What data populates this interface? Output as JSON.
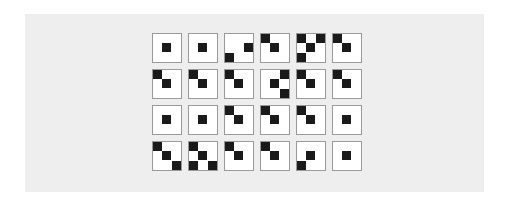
{
  "colors": {
    "page_background": "#ffffff",
    "panel_background": "#eeeeee",
    "cell_background": "#ffffff",
    "cell_border": "#9a9a9a",
    "dot": "#1a1a1a"
  },
  "grid": {
    "rows": 4,
    "columns": 6,
    "subgrid": 3,
    "cells": [
      [
        [
          [
            1,
            1
          ]
        ],
        [
          [
            1,
            1
          ]
        ],
        [
          [
            1,
            2
          ],
          [
            2,
            0
          ]
        ],
        [
          [
            0,
            0
          ],
          [
            1,
            1
          ]
        ],
        [
          [
            0,
            0
          ],
          [
            0,
            2
          ],
          [
            1,
            1
          ],
          [
            2,
            0
          ]
        ],
        [
          [
            0,
            0
          ],
          [
            1,
            1
          ]
        ]
      ],
      [
        [
          [
            0,
            0
          ],
          [
            1,
            1
          ]
        ],
        [
          [
            0,
            0
          ],
          [
            1,
            1
          ]
        ],
        [
          [
            0,
            0
          ],
          [
            1,
            1
          ]
        ],
        [
          [
            0,
            2
          ],
          [
            1,
            1
          ],
          [
            2,
            2
          ]
        ],
        [
          [
            0,
            0
          ],
          [
            1,
            1
          ]
        ],
        [
          [
            0,
            0
          ],
          [
            1,
            1
          ]
        ]
      ],
      [
        [
          [
            1,
            1
          ]
        ],
        [
          [
            1,
            1
          ]
        ],
        [
          [
            0,
            0
          ],
          [
            1,
            1
          ]
        ],
        [
          [
            0,
            0
          ],
          [
            1,
            1
          ]
        ],
        [
          [
            0,
            0
          ],
          [
            1,
            1
          ]
        ],
        [
          [
            1,
            1
          ]
        ]
      ],
      [
        [
          [
            0,
            0
          ],
          [
            1,
            1
          ],
          [
            2,
            2
          ]
        ],
        [
          [
            0,
            0
          ],
          [
            1,
            1
          ],
          [
            2,
            0
          ],
          [
            2,
            2
          ]
        ],
        [
          [
            0,
            0
          ],
          [
            1,
            1
          ]
        ],
        [
          [
            0,
            0
          ],
          [
            1,
            1
          ]
        ],
        [
          [
            1,
            1
          ],
          [
            2,
            0
          ]
        ],
        [
          [
            1,
            1
          ]
        ]
      ]
    ]
  }
}
